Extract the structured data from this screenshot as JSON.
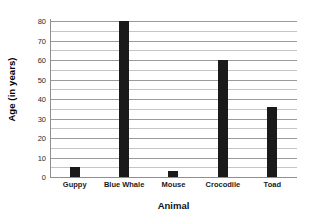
{
  "chart_data": {
    "type": "bar",
    "title": "",
    "xlabel": "Animal",
    "ylabel": "Age (in years)",
    "categories": [
      "Guppy",
      "Blue Whale",
      "Mouse",
      "Crocodile",
      "Toad"
    ],
    "values": [
      5,
      80,
      3,
      60,
      36
    ],
    "ylim": [
      0,
      80
    ],
    "ytick_labels": [
      "0",
      "10",
      "20",
      "30",
      "40",
      "50",
      "60",
      "70",
      "80"
    ],
    "ytick_values": [
      0,
      10,
      20,
      30,
      40,
      50,
      60,
      70,
      80
    ],
    "minor_tick_values": [
      5,
      15,
      25,
      35,
      45,
      55,
      65,
      75
    ],
    "grid": true,
    "legend": false,
    "bar_color": "#1a1a1a",
    "gridline_color": "#9b9b9b",
    "minor_gridline_color": "#c4c4c4",
    "axis_color": "#8f8f8f",
    "background": "#ffffff"
  }
}
